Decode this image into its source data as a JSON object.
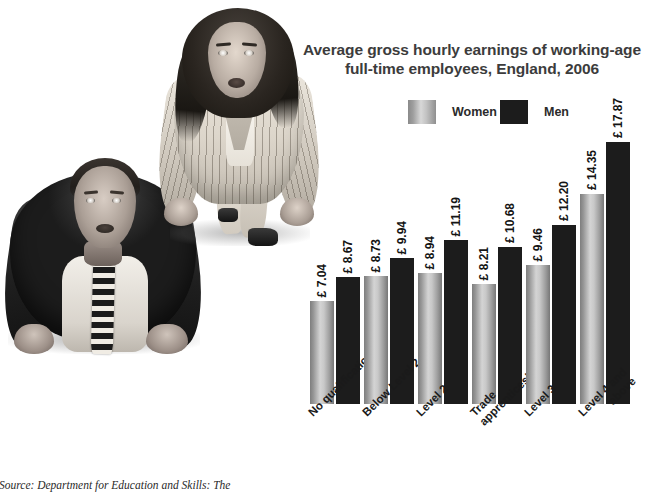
{
  "chart_data": {
    "type": "bar",
    "title_line1": "Average gross hourly earnings of working-age",
    "title_line2": "full-time employees, England, 2006",
    "categories": [
      "No qualifications",
      "Below Level 2",
      "Level 2",
      "Trade apprenticeships",
      "Level 3",
      "Level 4 and above"
    ],
    "series": [
      {
        "name": "Women",
        "values": [
          7.04,
          8.73,
          8.94,
          8.21,
          9.46,
          14.35
        ],
        "labels": [
          "£ 7.04",
          "£ 8.73",
          "£ 8.94",
          "£ 8.21",
          "£ 9.46",
          "£ 14.35"
        ],
        "color": "#c8c8c8"
      },
      {
        "name": "Men",
        "values": [
          8.67,
          9.94,
          11.19,
          10.68,
          12.2,
          17.87
        ],
        "labels": [
          "£ 8.67",
          "£ 9.94",
          "£ 11.19",
          "£ 10.68",
          "£ 12.20",
          "£ 17.87"
        ],
        "color": "#1c1c1c"
      }
    ],
    "xlabel": "",
    "ylabel": "",
    "ylim": [
      0,
      17.87
    ],
    "grid": false,
    "legend_position": "top"
  },
  "legend": {
    "women_label": "Women",
    "men_label": "Men"
  },
  "categories_display": [
    {
      "line1": "No qualifications",
      "line2": ""
    },
    {
      "line1": "Below Level 2",
      "line2": ""
    },
    {
      "line1": "Level 2",
      "line2": ""
    },
    {
      "line1": "Trade",
      "line2": "apprenticeships"
    },
    {
      "line1": "Level 3",
      "line2": ""
    },
    {
      "line1": "Level 4 and",
      "line2": "above"
    }
  ],
  "source": {
    "text": "Source: Department for Education and Skills: The"
  },
  "photos": {
    "man_alt": "man-in-suit-starting-pose",
    "woman_alt": "woman-in-pinstripe-suit-starting-pose"
  },
  "colors": {
    "women_bar": "#c8c8c8",
    "men_bar": "#1c1c1c",
    "title_text": "#3c3c3c",
    "background": "#ffffff"
  }
}
